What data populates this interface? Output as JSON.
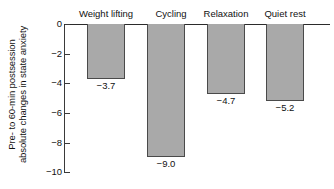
{
  "chart_data": {
    "type": "bar",
    "title": "",
    "subtitle": "",
    "xlabel": "",
    "ylabel_lines": [
      "Pre- to 60-min postsession",
      "absolute changes in state anxiety"
    ],
    "categories": [
      "Weight lifting",
      "Cycling",
      "Relaxation",
      "Quiet rest"
    ],
    "values": [
      -3.7,
      -9.0,
      -4.7,
      -5.2
    ],
    "value_labels": [
      "−3.7",
      "−9.0",
      "−4.7",
      "−5.2"
    ],
    "ylim": [
      -10,
      0
    ],
    "yticks": [
      0,
      -2,
      -4,
      -6,
      -8,
      -10
    ],
    "ytick_labels": [
      "0",
      "−2",
      "−4",
      "−6",
      "−8",
      "−10"
    ],
    "grid": false,
    "legend": false,
    "legend_position": "none",
    "bar_fill_color": "#a9a9a9",
    "bar_edge_color": "#4a4a4a",
    "axis_color": "#2b2b2b",
    "text_color": "#111111",
    "background_color": "#ffffff",
    "category_label_position": "above-axis",
    "value_label_position": "below-bar"
  }
}
